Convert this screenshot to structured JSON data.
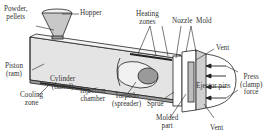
{
  "figure": {
    "labels": {
      "powder": "Powder,\npellets",
      "hopper": "Hopper",
      "heating_zones": "Heating\nzones",
      "nozzle": "Nozzle",
      "mold": "Mold",
      "vent_top": "Vent",
      "piston": "Piston\n(ram)",
      "cooling_zone": "Cooling\nzone",
      "cylinder": "Cylinder\n(barrel)",
      "injection_chamber": "Injection\nchamber",
      "torpedo": "Torpedo\n(spreader)",
      "sprue": "Sprue",
      "ejector_pins": "Ejector pins",
      "press_force": "Press\n(clamp)\nforce",
      "molded_part": "Molded\npart",
      "vent_bottom": "Vent"
    },
    "colors": {
      "line": "#222222",
      "fill_light": "#e6e6e6",
      "fill_mid": "#bdbdbd",
      "fill_dark": "#8c8c8c",
      "text": "#333333"
    }
  }
}
